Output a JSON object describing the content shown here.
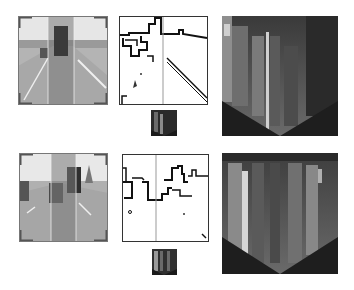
{
  "figure": {
    "rows": [
      {
        "id": "row-1",
        "scene": "road with truck ahead",
        "panels": [
          "original-frame",
          "edge-map",
          "thumbnail",
          "accumulation-map"
        ]
      },
      {
        "id": "row-2",
        "scene": "road with multiple vehicles",
        "panels": [
          "original-frame",
          "edge-map",
          "thumbnail",
          "accumulation-map"
        ]
      }
    ],
    "colors": {
      "background": "#ffffff",
      "frame_border": "#555555",
      "roi_band": "#8a8a8a",
      "edge_stroke": "#111111",
      "accum_dark": "#1e1e1e",
      "accum_bright": "#d8d8d8"
    }
  }
}
